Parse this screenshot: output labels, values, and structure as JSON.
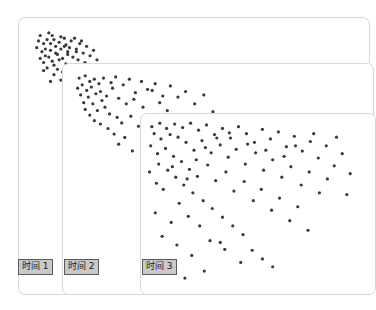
{
  "figure": {
    "title": "",
    "background_color": "#ffffff",
    "panel_fill": "#ffffff",
    "panel_border_color": "#d8d8d8",
    "point_color": "#3a3a3a",
    "label_fill": "#c9c9c9",
    "label_border": "#5a5a5a",
    "label_text_color": "#1a1a1a"
  },
  "panels": [
    {
      "id": "panel-1",
      "label": "时间 1",
      "point_count": 60
    },
    {
      "id": "panel-2",
      "label": "时间 2",
      "point_count": 62
    },
    {
      "id": "panel-3",
      "label": "时间 3",
      "point_count": 110
    }
  ],
  "chart_data": {
    "type": "scatter",
    "title": "",
    "xlabel": "",
    "ylabel": "",
    "grid": false,
    "legend_position": "none",
    "axis_ranges": {
      "xlim": [
        0,
        1
      ],
      "ylim": [
        0,
        1
      ]
    },
    "note": "Three cascading panels showing progressive diffusion of points from a tight top-left cluster toward a broad scatter over time.",
    "series": [
      {
        "name": "时间 1",
        "panel": "panel-1",
        "marker_size": 1.6,
        "color": "#3a3a3a",
        "points": [
          [
            5.0,
            5.0
          ],
          [
            7.5,
            4.0
          ],
          [
            9.0,
            6.5
          ],
          [
            6.0,
            8.0
          ],
          [
            11.0,
            5.5
          ],
          [
            8.0,
            10.5
          ],
          [
            12.5,
            8.5
          ],
          [
            4.0,
            9.5
          ],
          [
            10.0,
            12.0
          ],
          [
            14.0,
            7.0
          ],
          [
            6.5,
            12.5
          ],
          [
            13.0,
            11.0
          ],
          [
            9.5,
            9.0
          ],
          [
            7.0,
            6.5
          ],
          [
            15.5,
            10.0
          ],
          [
            11.5,
            13.5
          ],
          [
            5.5,
            11.0
          ],
          [
            16.5,
            8.0
          ],
          [
            8.5,
            14.5
          ],
          [
            12.0,
            6.0
          ],
          [
            10.5,
            7.5
          ],
          [
            14.5,
            13.0
          ],
          [
            6.0,
            15.0
          ],
          [
            17.5,
            11.5
          ],
          [
            9.0,
            16.0
          ],
          [
            13.5,
            9.5
          ],
          [
            7.5,
            13.0
          ],
          [
            16.0,
            14.0
          ],
          [
            11.0,
            10.0
          ],
          [
            4.5,
            7.0
          ],
          [
            18.5,
            9.0
          ],
          [
            10.0,
            17.5
          ],
          [
            15.0,
            6.0
          ],
          [
            8.0,
            8.0
          ],
          [
            12.5,
            15.5
          ],
          [
            19.5,
            12.5
          ],
          [
            6.5,
            10.0
          ],
          [
            14.0,
            16.5
          ],
          [
            9.5,
            11.5
          ],
          [
            17.0,
            7.0
          ],
          [
            11.5,
            18.5
          ],
          [
            5.0,
            13.5
          ],
          [
            20.5,
            10.5
          ],
          [
            13.0,
            12.0
          ],
          [
            8.5,
            5.0
          ],
          [
            16.0,
            17.5
          ],
          [
            10.5,
            14.0
          ],
          [
            7.0,
            17.0
          ],
          [
            18.0,
            15.0
          ],
          [
            12.0,
            9.0
          ],
          [
            21.5,
            14.0
          ],
          [
            9.0,
            19.5
          ],
          [
            15.5,
            11.0
          ],
          [
            6.0,
            18.0
          ],
          [
            19.0,
            17.0
          ],
          [
            13.5,
            19.0
          ],
          [
            11.0,
            21.5
          ],
          [
            17.5,
            19.5
          ],
          [
            8.0,
            22.0
          ],
          [
            14.5,
            22.5
          ]
        ]
      },
      {
        "name": "时间 2",
        "panel": "panel-2",
        "marker_size": 1.6,
        "color": "#3a3a3a",
        "points": [
          [
            4.0,
            4.5
          ],
          [
            6.0,
            3.5
          ],
          [
            7.5,
            6.0
          ],
          [
            5.0,
            7.5
          ],
          [
            9.0,
            5.0
          ],
          [
            3.5,
            9.0
          ],
          [
            10.5,
            7.0
          ],
          [
            6.5,
            10.0
          ],
          [
            12.0,
            4.5
          ],
          [
            8.0,
            8.5
          ],
          [
            4.5,
            12.0
          ],
          [
            11.0,
            10.5
          ],
          [
            14.5,
            6.5
          ],
          [
            7.0,
            13.0
          ],
          [
            9.5,
            11.5
          ],
          [
            16.0,
            4.0
          ],
          [
            5.5,
            15.5
          ],
          [
            13.0,
            12.5
          ],
          [
            18.5,
            7.5
          ],
          [
            8.5,
            16.0
          ],
          [
            11.5,
            14.5
          ],
          [
            20.5,
            5.0
          ],
          [
            6.0,
            18.5
          ],
          [
            15.0,
            9.0
          ],
          [
            22.5,
            11.0
          ],
          [
            10.0,
            19.0
          ],
          [
            17.0,
            13.5
          ],
          [
            24.5,
            6.0
          ],
          [
            12.5,
            17.5
          ],
          [
            19.5,
            16.0
          ],
          [
            7.5,
            21.0
          ],
          [
            26.5,
            9.5
          ],
          [
            14.0,
            20.5
          ],
          [
            22.0,
            14.0
          ],
          [
            9.0,
            23.5
          ],
          [
            29.0,
            7.0
          ],
          [
            16.5,
            22.0
          ],
          [
            25.0,
            17.5
          ],
          [
            11.0,
            25.0
          ],
          [
            31.5,
            12.5
          ],
          [
            18.0,
            24.5
          ],
          [
            28.0,
            10.0
          ],
          [
            13.5,
            27.0
          ],
          [
            34.0,
            8.0
          ],
          [
            21.0,
            21.5
          ],
          [
            30.5,
            15.5
          ],
          [
            15.5,
            29.5
          ],
          [
            36.5,
            13.0
          ],
          [
            23.5,
            26.0
          ],
          [
            33.0,
            19.0
          ],
          [
            19.0,
            31.0
          ],
          [
            39.0,
            10.5
          ],
          [
            27.0,
            23.0
          ],
          [
            36.0,
            22.5
          ],
          [
            17.0,
            34.0
          ],
          [
            42.0,
            16.0
          ],
          [
            30.0,
            28.5
          ],
          [
            25.5,
            33.5
          ],
          [
            45.0,
            12.0
          ],
          [
            38.5,
            26.0
          ],
          [
            21.5,
            37.0
          ],
          [
            48.0,
            19.5
          ]
        ]
      },
      {
        "name": "时间 3",
        "panel": "panel-3",
        "marker_size": 1.6,
        "color": "#3a3a3a",
        "points": [
          [
            3.0,
            5.0
          ],
          [
            6.5,
            3.0
          ],
          [
            4.0,
            9.0
          ],
          [
            9.5,
            6.0
          ],
          [
            13.0,
            3.5
          ],
          [
            7.0,
            12.0
          ],
          [
            16.5,
            5.5
          ],
          [
            2.5,
            16.0
          ],
          [
            11.0,
            9.5
          ],
          [
            20.0,
            3.0
          ],
          [
            14.5,
            11.0
          ],
          [
            5.5,
            20.5
          ],
          [
            23.5,
            7.0
          ],
          [
            18.0,
            14.0
          ],
          [
            9.0,
            17.5
          ],
          [
            27.0,
            4.0
          ],
          [
            12.5,
            22.0
          ],
          [
            30.5,
            9.5
          ],
          [
            21.5,
            18.5
          ],
          [
            6.0,
            26.5
          ],
          [
            34.0,
            6.0
          ],
          [
            16.0,
            25.0
          ],
          [
            25.0,
            13.0
          ],
          [
            37.5,
            11.5
          ],
          [
            10.0,
            30.0
          ],
          [
            29.0,
            20.0
          ],
          [
            41.0,
            5.0
          ],
          [
            19.5,
            29.5
          ],
          [
            33.0,
            15.5
          ],
          [
            13.5,
            34.0
          ],
          [
            44.5,
            9.0
          ],
          [
            23.0,
            33.5
          ],
          [
            36.5,
            22.5
          ],
          [
            48.0,
            14.0
          ],
          [
            17.0,
            38.5
          ],
          [
            27.5,
            27.0
          ],
          [
            51.5,
            6.5
          ],
          [
            40.0,
            18.0
          ],
          [
            31.0,
            36.0
          ],
          [
            55.0,
            12.0
          ],
          [
            21.0,
            43.0
          ],
          [
            44.0,
            26.5
          ],
          [
            35.5,
            31.0
          ],
          [
            58.5,
            8.0
          ],
          [
            25.5,
            47.5
          ],
          [
            48.5,
            20.0
          ],
          [
            62.0,
            16.5
          ],
          [
            39.0,
            42.0
          ],
          [
            29.5,
            52.0
          ],
          [
            52.0,
            30.0
          ],
          [
            65.5,
            10.5
          ],
          [
            43.5,
            36.5
          ],
          [
            34.0,
            57.0
          ],
          [
            56.0,
            24.0
          ],
          [
            69.0,
            19.0
          ],
          [
            47.5,
            47.5
          ],
          [
            38.5,
            62.0
          ],
          [
            60.0,
            34.0
          ],
          [
            72.5,
            13.5
          ],
          [
            51.0,
            41.0
          ],
          [
            43.0,
            67.0
          ],
          [
            64.0,
            28.0
          ],
          [
            76.0,
            23.0
          ],
          [
            55.5,
            53.0
          ],
          [
            33.0,
            71.5
          ],
          [
            68.5,
            38.5
          ],
          [
            79.5,
            16.0
          ],
          [
            59.0,
            46.0
          ],
          [
            47.0,
            76.0
          ],
          [
            72.0,
            31.0
          ],
          [
            83.0,
            27.5
          ],
          [
            63.5,
            59.0
          ],
          [
            51.5,
            81.0
          ],
          [
            76.5,
            43.0
          ],
          [
            86.5,
            20.5
          ],
          [
            67.0,
            51.0
          ],
          [
            56.0,
            85.5
          ],
          [
            80.0,
            35.0
          ],
          [
            90.0,
            32.0
          ],
          [
            71.5,
            64.5
          ],
          [
            8.0,
            41.0
          ],
          [
            15.0,
            49.0
          ],
          [
            4.5,
            54.5
          ],
          [
            11.5,
            60.0
          ],
          [
            19.0,
            56.5
          ],
          [
            7.5,
            68.0
          ],
          [
            24.0,
            62.0
          ],
          [
            14.0,
            73.0
          ],
          [
            28.5,
            70.5
          ],
          [
            20.5,
            79.0
          ],
          [
            9.0,
            85.0
          ],
          [
            35.0,
            75.5
          ],
          [
            26.0,
            88.0
          ],
          [
            42.0,
            83.0
          ],
          [
            17.5,
            92.0
          ],
          [
            2.0,
            31.0
          ],
          [
            5.0,
            37.5
          ],
          [
            12.0,
            28.0
          ],
          [
            18.5,
            35.0
          ],
          [
            22.5,
            24.0
          ],
          [
            31.5,
            11.5
          ],
          [
            26.5,
            17.0
          ],
          [
            37.0,
            8.5
          ],
          [
            45.0,
            15.0
          ],
          [
            53.0,
            18.5
          ],
          [
            61.0,
            22.0
          ],
          [
            84.0,
            11.0
          ],
          [
            88.5,
            44.0
          ],
          [
            66.0,
            16.0
          ],
          [
            74.0,
            9.0
          ]
        ]
      }
    ]
  }
}
